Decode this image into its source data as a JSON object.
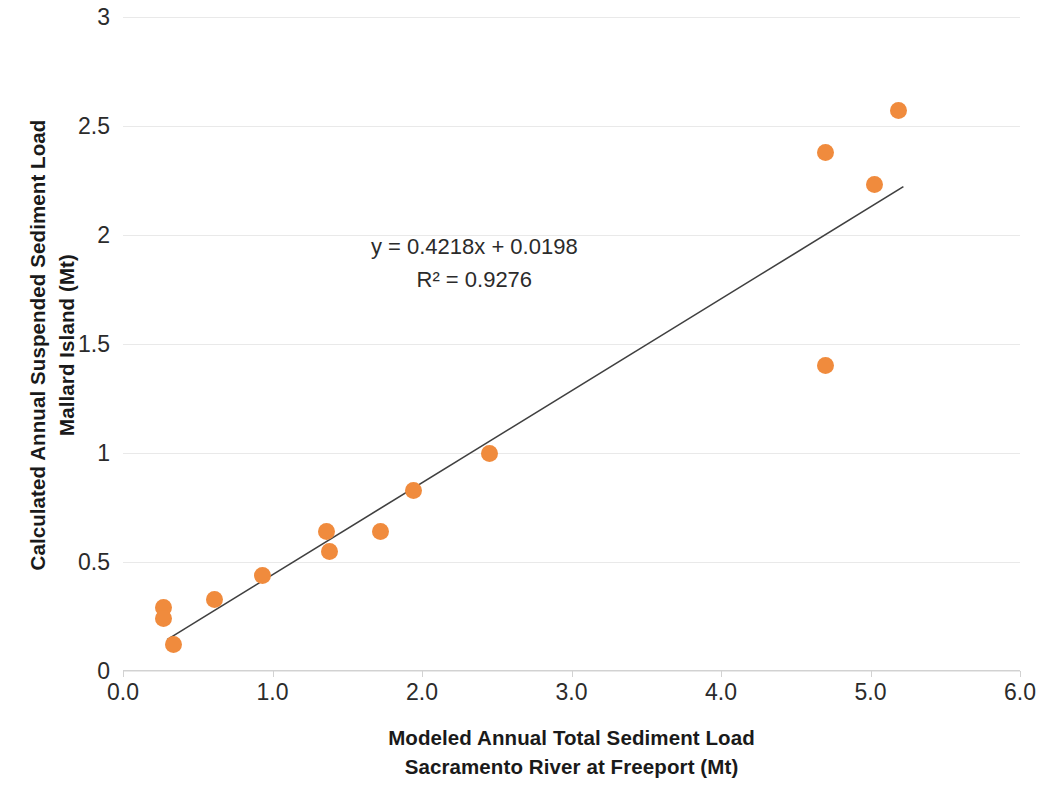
{
  "chart_data": {
    "type": "scatter",
    "title": "",
    "xlabel": "Modeled Annual Total Sediment Load Sacramento River at Freeport (Mt)",
    "ylabel": "Calculated Annual Suspended Sediment Load Mallard Island (Mt)",
    "xlabel_lines": [
      "Modeled Annual Total Sediment Load",
      "Sacramento River at Freeport (Mt)"
    ],
    "ylabel_lines": [
      "Calculated Annual Suspended Sediment  Load",
      "Mallard Island (Mt)"
    ],
    "xlim": [
      0.0,
      6.0
    ],
    "ylim": [
      0,
      3
    ],
    "xticks": [
      "0.0",
      "1.0",
      "2.0",
      "3.0",
      "4.0",
      "5.0",
      "6.0"
    ],
    "xtick_values": [
      0.0,
      1.0,
      2.0,
      3.0,
      4.0,
      5.0,
      6.0
    ],
    "yticks": [
      "0",
      "0.5",
      "1",
      "1.5",
      "2",
      "2.5",
      "3"
    ],
    "ytick_values": [
      0,
      0.5,
      1,
      1.5,
      2,
      2.5,
      3
    ],
    "grid": "horizontal",
    "legend": "none",
    "marker_color": "#f08b3d",
    "trendline_color": "#404040",
    "gridline_color": "#e9e9e9",
    "x": [
      0.27,
      0.27,
      0.34,
      0.61,
      0.93,
      1.36,
      1.38,
      1.72,
      1.94,
      2.45,
      4.7,
      4.7,
      5.03,
      5.19
    ],
    "y": [
      0.29,
      0.24,
      0.12,
      0.33,
      0.44,
      0.64,
      0.55,
      0.64,
      0.83,
      1.0,
      1.4,
      2.38,
      2.23,
      2.57
    ],
    "points": [
      {
        "x": 0.27,
        "y": 0.29
      },
      {
        "x": 0.27,
        "y": 0.24
      },
      {
        "x": 0.34,
        "y": 0.12
      },
      {
        "x": 0.61,
        "y": 0.33
      },
      {
        "x": 0.93,
        "y": 0.44
      },
      {
        "x": 1.36,
        "y": 0.64
      },
      {
        "x": 1.38,
        "y": 0.55
      },
      {
        "x": 1.72,
        "y": 0.64
      },
      {
        "x": 1.94,
        "y": 0.83
      },
      {
        "x": 2.45,
        "y": 1.0
      },
      {
        "x": 4.7,
        "y": 1.4
      },
      {
        "x": 4.7,
        "y": 2.38
      },
      {
        "x": 5.03,
        "y": 2.23
      },
      {
        "x": 5.19,
        "y": 2.57
      }
    ],
    "trendline": {
      "slope": 0.4218,
      "intercept": 0.0198,
      "x_start": 0.295,
      "x_end": 5.22
    },
    "annotations": {
      "equation": "y = 0.4218x + 0.0198",
      "r_squared": "R² = 0.9276",
      "position_x": 2.35,
      "position_y": 1.93
    }
  }
}
